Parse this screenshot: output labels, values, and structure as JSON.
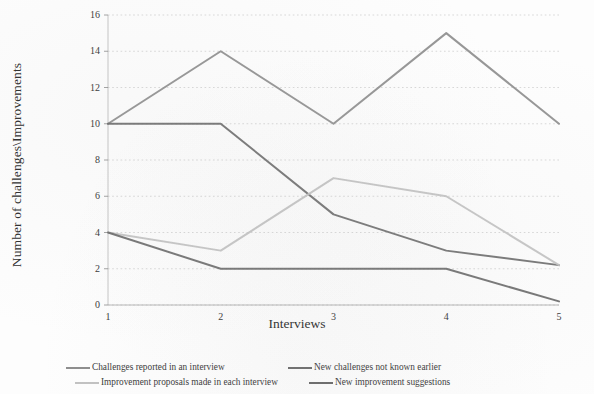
{
  "chart_data": {
    "type": "line",
    "title": "",
    "xlabel": "Interviews",
    "ylabel": "Number of challenges\\Improvements",
    "x": [
      1,
      2,
      3,
      4,
      5
    ],
    "categories": [
      "1",
      "2",
      "3",
      "4",
      "5"
    ],
    "xlim": [
      1,
      5
    ],
    "ylim": [
      0,
      16
    ],
    "yticks": [
      0,
      2,
      4,
      6,
      8,
      10,
      12,
      14,
      16
    ],
    "ytick_labels": [
      "0",
      "2",
      "4",
      "6",
      "8",
      "10",
      "12",
      "14",
      "16"
    ],
    "xticks": [
      1,
      2,
      3,
      4,
      5
    ],
    "xtick_labels": [
      "1",
      "2",
      "3",
      "4",
      "5"
    ],
    "grid": "horizontal-dotted",
    "legend_position": "bottom",
    "series": [
      {
        "name": "Challenges reported in an interview",
        "values": [
          10,
          14,
          10,
          15,
          10
        ],
        "color": "#8e8e8e"
      },
      {
        "name": "New challenges not known earlier",
        "values": [
          10,
          10,
          5,
          3,
          2.2
        ],
        "color": "#6e6e6e"
      },
      {
        "name": "Improvement proposals made in each interview",
        "values": [
          4,
          3,
          7,
          6,
          2.2
        ],
        "color": "#c2c2c2"
      },
      {
        "name": "New improvement suggestions",
        "values": [
          4,
          2,
          2,
          2,
          0.2
        ],
        "color": "#6b6b6b"
      }
    ]
  },
  "axis": {
    "y_title": "Number of challenges\\Improvements",
    "x_title": "Interviews"
  },
  "legend": {
    "entries": [
      {
        "label": "Challenges reported in an interview",
        "color": "#8e8e8e"
      },
      {
        "label": "New challenges not known earlier",
        "color": "#6e6e6e"
      },
      {
        "label": "Improvement proposals made in each interview",
        "color": "#c2c2c2"
      },
      {
        "label": "New improvement suggestions",
        "color": "#6b6b6b"
      }
    ]
  }
}
